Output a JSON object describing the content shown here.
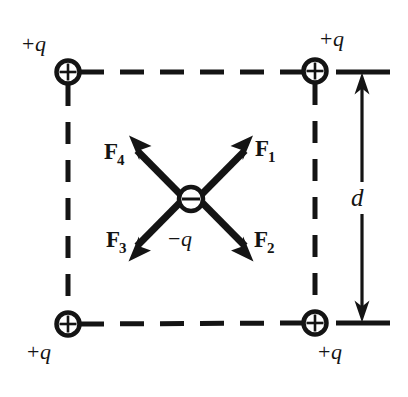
{
  "figure": {
    "background_color": "#ffffff",
    "ink_color": "#141414",
    "width": 408,
    "height": 397
  },
  "charges": {
    "top_left": {
      "label_sign": "+",
      "label_symbol": "q",
      "glyph": "+",
      "cx": 68,
      "cy": 72
    },
    "top_right": {
      "label_sign": "+",
      "label_symbol": "q",
      "glyph": "+",
      "cx": 315,
      "cy": 71
    },
    "bottom_left": {
      "label_sign": "+",
      "label_symbol": "q",
      "glyph": "+",
      "cx": 68,
      "cy": 324
    },
    "bottom_right": {
      "label_sign": "+",
      "label_symbol": "q",
      "glyph": "+",
      "cx": 315,
      "cy": 323
    },
    "center": {
      "label_sign": "−",
      "label_symbol": "q",
      "glyph": "−",
      "cx": 191,
      "cy": 199
    }
  },
  "forces": [
    {
      "name": "F1",
      "label_main": "F",
      "label_sub": "1",
      "direction": "up-right",
      "tip_x": 252,
      "tip_y": 136
    },
    {
      "name": "F2",
      "label_main": "F",
      "label_sub": "2",
      "direction": "down-right",
      "tip_x": 252,
      "tip_y": 261
    },
    {
      "name": "F3",
      "label_main": "F",
      "label_sub": "3",
      "direction": "down-left",
      "tip_x": 132,
      "tip_y": 261
    },
    {
      "name": "F4",
      "label_main": "F",
      "label_sub": "4",
      "direction": "up-left",
      "tip_x": 132,
      "tip_y": 136
    }
  ],
  "dimension": {
    "label": "d",
    "line_x": 362,
    "top_y": 72,
    "bottom_y": 323,
    "tick_top_x1": 336,
    "tick_top_x2": 390,
    "tick_bottom_x1": 336,
    "tick_bottom_x2": 390
  },
  "square_edges": {
    "style": "dashed",
    "top": {
      "x1": 80,
      "y1": 72,
      "x2": 303,
      "y2": 72
    },
    "bottom": {
      "x1": 80,
      "y1": 324,
      "x2": 303,
      "y2": 323
    },
    "left": {
      "x1": 68,
      "y1": 84,
      "x2": 68,
      "y2": 312
    },
    "right": {
      "x1": 315,
      "y1": 83,
      "x2": 315,
      "y2": 311
    }
  }
}
